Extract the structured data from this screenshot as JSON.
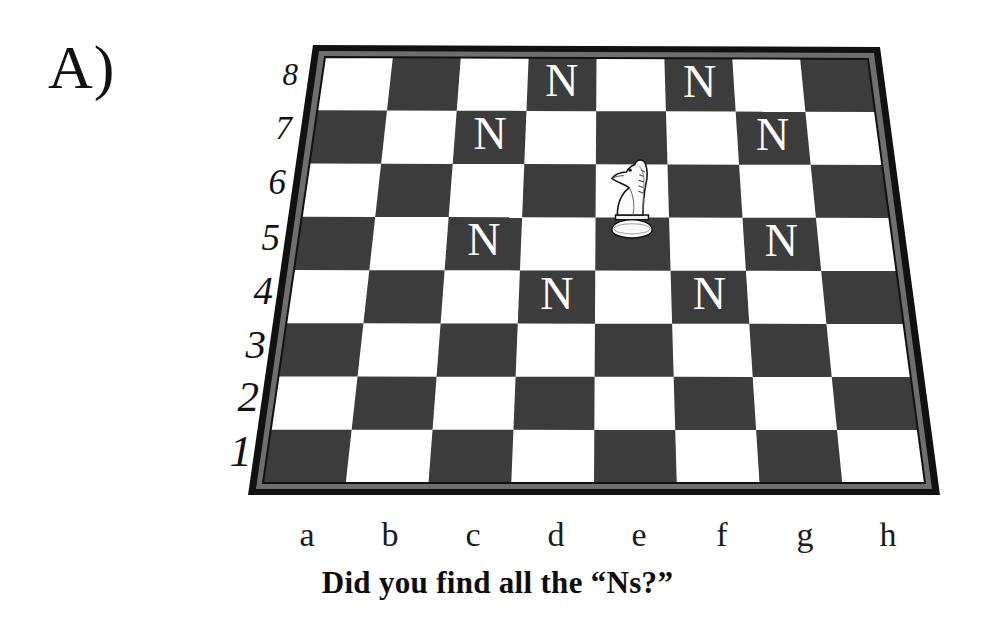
{
  "panel": {
    "label": "A)"
  },
  "caption": {
    "text": "Did you find all the “Ns?”"
  },
  "board": {
    "rank_labels": [
      "8",
      "7",
      "6",
      "5",
      "4",
      "3",
      "2",
      "1"
    ],
    "file_labels": [
      "a",
      "b",
      "c",
      "d",
      "e",
      "f",
      "g",
      "h"
    ],
    "colors": {
      "light_square": "#ffffff",
      "dark_square": "#3c3c3c",
      "frame_outer": "#111111",
      "frame_inner": "#6a6a6a",
      "marker_light": "#ffffff",
      "text": "#121212"
    },
    "piece": {
      "type": "knight",
      "color": "white",
      "square": "e6"
    },
    "markers": [
      {
        "label": "N",
        "square": "d8",
        "file": 3,
        "rank": 7,
        "square_shade": "dark"
      },
      {
        "label": "N",
        "square": "f8",
        "file": 5,
        "rank": 7,
        "square_shade": "dark"
      },
      {
        "label": "N",
        "square": "c7",
        "file": 2,
        "rank": 6,
        "square_shade": "dark"
      },
      {
        "label": "N",
        "square": "g7",
        "file": 6,
        "rank": 6,
        "square_shade": "dark"
      },
      {
        "label": "N",
        "square": "c5",
        "file": 2,
        "rank": 4,
        "square_shade": "dark"
      },
      {
        "label": "N",
        "square": "g5",
        "file": 6,
        "rank": 4,
        "square_shade": "dark"
      },
      {
        "label": "N",
        "square": "d4",
        "file": 3,
        "rank": 3,
        "square_shade": "dark"
      },
      {
        "label": "N",
        "square": "f4",
        "file": 5,
        "rank": 3,
        "square_shade": "dark"
      }
    ]
  },
  "chart_data": {
    "type": "table",
    "categories": [
      "a",
      "b",
      "c",
      "d",
      "e",
      "f",
      "g",
      "h"
    ],
    "rows": [
      "8",
      "7",
      "6",
      "5",
      "4",
      "3",
      "2",
      "1"
    ],
    "marked_squares": [
      "d8",
      "f8",
      "c7",
      "g7",
      "c5",
      "g5",
      "d4",
      "f4"
    ],
    "piece_square": "e6",
    "marker_count": 8
  }
}
